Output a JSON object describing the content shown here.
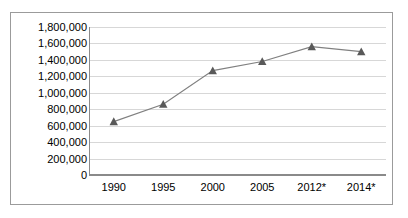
{
  "chart_data": {
    "type": "line",
    "title": "",
    "subtitle": "",
    "xlabel": "",
    "ylabel": "",
    "categories": [
      "1990",
      "1995",
      "2000",
      "2005",
      "2012*",
      "2014*"
    ],
    "values": [
      650000,
      860000,
      1270000,
      1380000,
      1560000,
      1500000
    ],
    "series": [
      {
        "name": "",
        "values": [
          650000,
          860000,
          1270000,
          1380000,
          1560000,
          1500000
        ]
      }
    ],
    "ylim": [
      0,
      1800000
    ],
    "ytick_step": 200000,
    "ytick_labels": [
      "1,800,000",
      "1,600,000",
      "1,400,000",
      "1,200,000",
      "1,000,000",
      "800,000",
      "600,000",
      "400,000",
      "200,000",
      "0"
    ],
    "ytick_values": [
      1800000,
      1600000,
      1400000,
      1200000,
      1000000,
      800000,
      600000,
      400000,
      200000,
      0
    ],
    "xtick_labels": [
      "1990",
      "1995",
      "2000",
      "2005",
      "2012*",
      "2014*"
    ],
    "grid": true,
    "grid_axis": "y",
    "legend": false,
    "legend_position": "none",
    "marker": "triangle",
    "line_color": "#808080",
    "marker_color": "#595959",
    "grid_color": "#d7d7d7",
    "axis_color": "#8a8a8a",
    "border_color": "#9b9b9b",
    "background_color": "#ffffff",
    "annotations": []
  }
}
